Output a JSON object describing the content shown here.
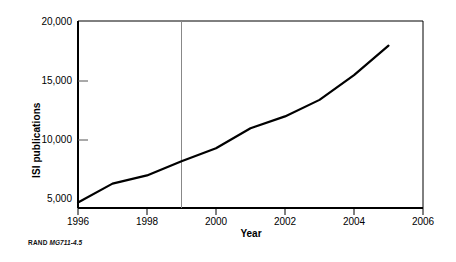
{
  "figure": {
    "caption_brand": "RAND",
    "caption_code": "MG711-4.5"
  },
  "chart_data": {
    "type": "line",
    "title": "",
    "subtitle": "",
    "xlabel": "Year",
    "ylabel": "ISI publications",
    "xlim": [
      1996,
      2006
    ],
    "ylim": [
      4000,
      20000
    ],
    "grid": false,
    "legend": null,
    "x_ticks": [
      1996,
      1998,
      2000,
      2002,
      2004,
      2006
    ],
    "x_tick_labels": [
      "1996",
      "1998",
      "2000",
      "2002",
      "2004",
      "2006"
    ],
    "y_ticks": [
      5000,
      10000,
      15000,
      20000
    ],
    "y_tick_labels": [
      "5,000",
      "10,000",
      "15,000",
      "20,000"
    ],
    "x": [
      1996,
      1997,
      1998,
      1999,
      2000,
      2001,
      2002,
      2003,
      2004,
      2005
    ],
    "values": [
      4700,
      6300,
      7000,
      8200,
      9300,
      11000,
      12000,
      13400,
      15500,
      18000
    ],
    "series": [
      {
        "name": "ISI publications",
        "color": "#000000",
        "values": [
          4700,
          6300,
          7000,
          8200,
          9300,
          11000,
          12000,
          13400,
          15500,
          18000
        ]
      }
    ],
    "annotations": [
      {
        "type": "vertical-line",
        "x": 1999,
        "label": "",
        "color": "#808080"
      }
    ],
    "axis_color": "#000000",
    "line_color": "#000000",
    "line_width": 2.2
  }
}
